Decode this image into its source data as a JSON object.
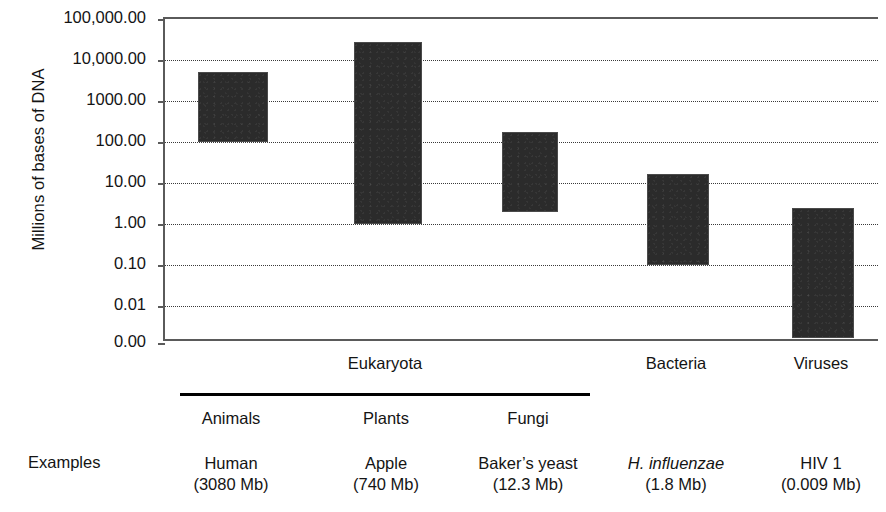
{
  "chart_data": {
    "type": "bar",
    "title": "",
    "subtitle": "",
    "xlabel": "",
    "ylabel": "Millions of bases of DNA",
    "scale": "log10",
    "grid": true,
    "legend": null,
    "ylim": [
      0.001,
      100000
    ],
    "ytick_labels": [
      "100,000.00",
      "10,000.00",
      "1000.00",
      "100.00",
      "10.00",
      "1.00",
      "0.10",
      "0.01",
      "0.00"
    ],
    "ytick_values": [
      100000,
      10000,
      1000,
      100,
      10,
      1,
      0.1,
      0.01,
      0.001
    ],
    "categories": [
      "Animals",
      "Plants",
      "Fungi",
      "Bacteria",
      "Viruses"
    ],
    "bar_kind": "range",
    "series": [
      {
        "name": "Genome size range (Mb)",
        "ranges": [
          {
            "category": "Animals",
            "low": 100,
            "high": 5000
          },
          {
            "category": "Plants",
            "low": 1,
            "high": 28000
          },
          {
            "category": "Fungi",
            "low": 2,
            "high": 180
          },
          {
            "category": "Bacteria",
            "low": 0.1,
            "high": 17
          },
          {
            "category": "Viruses",
            "low": 0.0017,
            "high": 2.4
          }
        ]
      }
    ],
    "annotations": {
      "domains": [
        {
          "label": "Eukaryota",
          "spans": [
            "Animals",
            "Plants",
            "Fungi"
          ]
        },
        {
          "label": "Bacteria",
          "spans": [
            "Bacteria"
          ]
        },
        {
          "label": "Viruses",
          "spans": [
            "Viruses"
          ]
        }
      ],
      "examples_row_label": "Examples",
      "examples": [
        {
          "category": "Animals",
          "species": "Human",
          "size": "(3080 Mb)",
          "italic": false
        },
        {
          "category": "Plants",
          "species": "Apple",
          "size": "(740 Mb)",
          "italic": false
        },
        {
          "category": "Fungi",
          "species": "Baker’s yeast",
          "size": "(12.3 Mb)",
          "italic": false
        },
        {
          "category": "Bacteria",
          "species": "H. influenzae",
          "size": "(1.8 Mb)",
          "italic": true
        },
        {
          "category": "Viruses",
          "species": "HIV 1",
          "size": "(0.009 Mb)",
          "italic": false
        }
      ]
    },
    "colors": {
      "bar": "#2b2b2b",
      "axis": "#5a5a5a",
      "grid": "#3a3a3a",
      "text": "#141414",
      "background": "#ffffff"
    }
  },
  "axis": {
    "y_title": "Millions of bases of DNA",
    "ticks": [
      {
        "label": "100,000.00",
        "value": 100000
      },
      {
        "label": "10,000.00",
        "value": 10000
      },
      {
        "label": "1000.00",
        "value": 1000
      },
      {
        "label": "100.00",
        "value": 100
      },
      {
        "label": "10.00",
        "value": 10
      },
      {
        "label": "1.00",
        "value": 1
      },
      {
        "label": "0.10",
        "value": 0.1
      },
      {
        "label": "0.01",
        "value": 0.01
      },
      {
        "label": "0.00",
        "value": 0.001
      }
    ]
  },
  "domains": [
    {
      "label": "Eukaryota"
    },
    {
      "label": "Bacteria"
    },
    {
      "label": "Viruses"
    }
  ],
  "kingdoms": [
    {
      "label": "Animals"
    },
    {
      "label": "Plants"
    },
    {
      "label": "Fungi"
    }
  ],
  "examples_label": "Examples",
  "examples": [
    {
      "species": "Human",
      "size": "(3080 Mb)"
    },
    {
      "species": "Apple",
      "size": "(740 Mb)"
    },
    {
      "species": "Baker’s yeast",
      "size": "(12.3 Mb)"
    },
    {
      "species": "H. influenzae",
      "size": "(1.8 Mb)"
    },
    {
      "species": "HIV 1",
      "size": "(0.009 Mb)"
    }
  ]
}
